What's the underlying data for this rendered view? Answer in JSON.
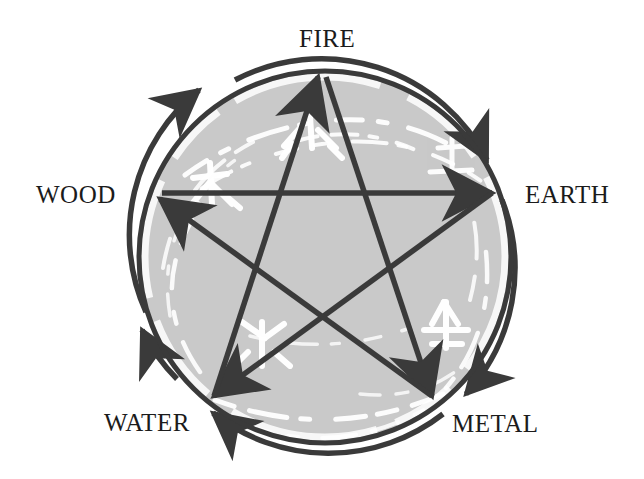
{
  "diagram": {
    "colors": {
      "background": "#ffffff",
      "disk_fill": "#c9c9c9",
      "disk_texture": "#ffffff",
      "stroke": "#3a3a3a",
      "label_text": "#1b1b1b"
    },
    "circle": {
      "center_x": 325,
      "center_y": 257,
      "radius": 186
    },
    "labels": [
      {
        "id": "fire",
        "text": "FIRE",
        "position": "top"
      },
      {
        "id": "wood",
        "text": "WOOD",
        "position": "left"
      },
      {
        "id": "earth",
        "text": "EARTH",
        "position": "right"
      },
      {
        "id": "water",
        "text": "WATER",
        "position": "bottom-left"
      },
      {
        "id": "metal",
        "text": "METAL",
        "position": "bottom-right"
      }
    ],
    "generating_cycle": {
      "name": "generating-cycle",
      "direction": "clockwise",
      "description": "Outer circular arrows around the rim",
      "sequence": [
        "WOOD",
        "FIRE",
        "EARTH",
        "METAL",
        "WATER",
        "WOOD"
      ]
    },
    "overcoming_cycle": {
      "name": "overcoming-cycle",
      "description": "Inner pentagram arrows",
      "arrows": [
        {
          "from": "WOOD",
          "to": "EARTH"
        },
        {
          "from": "EARTH",
          "to": "WATER"
        },
        {
          "from": "WATER",
          "to": "FIRE"
        },
        {
          "from": "FIRE",
          "to": "METAL"
        },
        {
          "from": "METAL",
          "to": "WOOD"
        }
      ]
    },
    "brush_characters": [
      {
        "element": "WOOD",
        "glyph": "木"
      },
      {
        "element": "FIRE",
        "glyph": "火"
      },
      {
        "element": "EARTH",
        "glyph": "土"
      },
      {
        "element": "WATER",
        "glyph": "水"
      },
      {
        "element": "METAL",
        "glyph": "金"
      }
    ]
  }
}
